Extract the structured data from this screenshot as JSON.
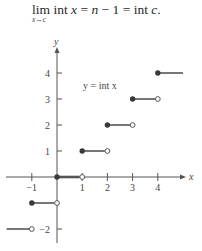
{
  "formula": {
    "lim": "lim",
    "subscript": "x→c",
    "part1": " int ",
    "var_x": "x",
    "part2": " = ",
    "var_n": "n",
    "part3": " − 1 = int ",
    "var_c": "c",
    "part4": "."
  },
  "chart_data": {
    "type": "line",
    "title": "",
    "function_label": "y = int x",
    "xlabel": "x",
    "ylabel": "y",
    "x_ticks": [
      -1,
      1,
      2,
      3,
      4
    ],
    "y_ticks": [
      -2,
      1,
      2,
      3,
      4
    ],
    "x_tick_labels": [
      "−1",
      "1",
      "2",
      "3",
      "4"
    ],
    "y_tick_labels": [
      "−2",
      "1",
      "2",
      "3",
      "4"
    ],
    "xlim": [
      -2,
      5
    ],
    "ylim": [
      -2.5,
      5
    ],
    "grid": false,
    "legend": null,
    "series": [
      {
        "name": "y = int x",
        "segments": [
          {
            "x_start": -2.0,
            "x_end": -1,
            "y": -2,
            "start": "none",
            "end": "open"
          },
          {
            "x_start": -1,
            "x_end": 0,
            "y": -1,
            "start": "closed",
            "end": "open"
          },
          {
            "x_start": 0,
            "x_end": 1,
            "y": 0,
            "start": "closed",
            "end": "open"
          },
          {
            "x_start": 1,
            "x_end": 2,
            "y": 1,
            "start": "closed",
            "end": "open"
          },
          {
            "x_start": 2,
            "x_end": 3,
            "y": 2,
            "start": "closed",
            "end": "open"
          },
          {
            "x_start": 3,
            "x_end": 4,
            "y": 3,
            "start": "closed",
            "end": "open"
          },
          {
            "x_start": 4,
            "x_end": 5.0,
            "y": 4,
            "start": "closed",
            "end": "none"
          }
        ]
      }
    ]
  },
  "colors": {
    "axis": "#555555",
    "segment": "#555555",
    "text": "#444444"
  }
}
